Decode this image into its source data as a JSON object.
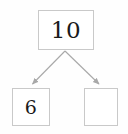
{
  "diagram": {
    "type": "number-bond",
    "title": "",
    "whole": {
      "label": "10",
      "value": 10
    },
    "parts": [
      {
        "label": "6",
        "value": 6,
        "position": "left",
        "filled": true
      },
      {
        "label": "",
        "value": null,
        "position": "right",
        "filled": false
      }
    ],
    "connectors": [
      {
        "name": "arrow-to-left-part",
        "from": "whole",
        "to": "part-left",
        "direction": "down-left"
      },
      {
        "name": "arrow-to-right-part",
        "from": "whole",
        "to": "part-right",
        "direction": "down-right"
      }
    ],
    "colors": {
      "background": "#fefefe",
      "box_fill": "#ffffff",
      "box_border": "#c9c9c9",
      "connector": "#a8a8a8",
      "text": "#1a1a1a"
    }
  }
}
